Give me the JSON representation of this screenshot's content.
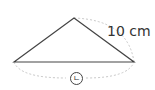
{
  "diagram": {
    "type": "isosceles-triangle",
    "side_label": "10 cm",
    "base_label": "ㄴ",
    "colors": {
      "line": "#444444",
      "dashed": "#c8c8c8",
      "text": "#333333"
    }
  }
}
